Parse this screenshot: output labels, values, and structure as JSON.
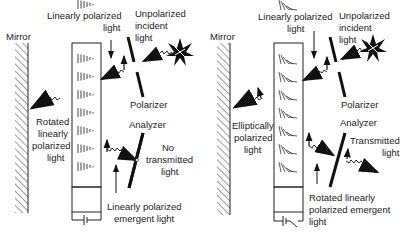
{
  "diagram": {
    "left_panel": {
      "mirror_label": "Mirror",
      "linearly_polarized_label": [
        "Linearly polarized",
        "light"
      ],
      "unpolarized_label": [
        "Unpolarized",
        "incident",
        "light"
      ],
      "polarizer_label": "Polarizer",
      "reflected_label": [
        "Rotated",
        "linearly",
        "polarized",
        "light"
      ],
      "analyzer_label": "Analyzer",
      "output_label": [
        "No",
        "transmitted",
        "light"
      ],
      "emergent_label": [
        "Linearly polarized",
        "emergent light"
      ],
      "switch_state": "closed",
      "cell_pattern": "aligned"
    },
    "right_panel": {
      "mirror_label": "Mirror",
      "linearly_polarized_label": [
        "Linearly polarized",
        "light"
      ],
      "unpolarized_label": [
        "Unpolarized",
        "incident",
        "light"
      ],
      "polarizer_label": "Polarizer",
      "reflected_label": [
        "Elliptically",
        "polarized",
        "light"
      ],
      "analyzer_label": "Analyzer",
      "output_label": [
        "Transmitted",
        "light"
      ],
      "emergent_label": [
        "Rotated linearly",
        "polarized emergent",
        "light"
      ],
      "switch_state": "open",
      "cell_pattern": "twisted"
    },
    "colors": {
      "ink": "#111111",
      "background": "#ffffff"
    }
  }
}
